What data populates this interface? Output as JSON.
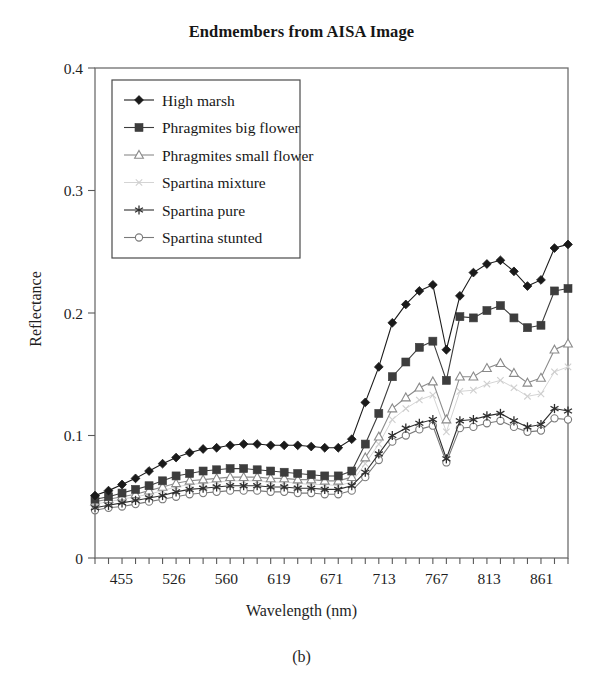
{
  "chart_data": {
    "type": "line",
    "title": "Endmembers from AISA Image",
    "caption": "(b)",
    "xlabel": "Wavelength (nm)",
    "ylabel": "Reflectance",
    "xtick_labels": [
      "455",
      "526",
      "560",
      "619",
      "671",
      "713",
      "767",
      "813",
      "861"
    ],
    "ytick_labels": [
      "0",
      "0.1",
      "0.2",
      "0.3",
      "0.4"
    ],
    "ylim": [
      0,
      0.4
    ],
    "xlim": [
      0,
      35
    ],
    "grid": false,
    "legend_position": "upper-left-inside",
    "x": [
      0,
      1,
      2,
      3,
      4,
      5,
      6,
      7,
      8,
      9,
      10,
      11,
      12,
      13,
      14,
      15,
      16,
      17,
      18,
      19,
      20,
      21,
      22,
      23,
      24,
      25,
      26,
      27,
      28,
      29,
      30,
      31,
      32,
      33,
      34,
      35
    ],
    "series": [
      {
        "name": "High marsh",
        "marker": "filled-diamond",
        "color": "#1a1a1a",
        "values": [
          0.051,
          0.055,
          0.06,
          0.065,
          0.071,
          0.077,
          0.082,
          0.086,
          0.089,
          0.09,
          0.092,
          0.093,
          0.093,
          0.092,
          0.092,
          0.092,
          0.091,
          0.09,
          0.09,
          0.097,
          0.127,
          0.156,
          0.192,
          0.207,
          0.218,
          0.223,
          0.17,
          0.214,
          0.233,
          0.24,
          0.243,
          0.234,
          0.222,
          0.227,
          0.253,
          0.256
        ]
      },
      {
        "name": "Phragmites big flower",
        "marker": "filled-square",
        "color": "#3d3d3d",
        "values": [
          0.048,
          0.05,
          0.053,
          0.056,
          0.059,
          0.063,
          0.067,
          0.069,
          0.071,
          0.072,
          0.073,
          0.073,
          0.072,
          0.071,
          0.07,
          0.069,
          0.068,
          0.067,
          0.067,
          0.071,
          0.093,
          0.118,
          0.148,
          0.16,
          0.172,
          0.177,
          0.145,
          0.197,
          0.196,
          0.202,
          0.206,
          0.196,
          0.188,
          0.19,
          0.218,
          0.22
        ]
      },
      {
        "name": "Phragmites small flower",
        "marker": "open-triangle",
        "color": "#8a8a8a",
        "values": [
          0.046,
          0.048,
          0.05,
          0.052,
          0.055,
          0.058,
          0.061,
          0.063,
          0.064,
          0.065,
          0.066,
          0.066,
          0.066,
          0.065,
          0.065,
          0.064,
          0.064,
          0.063,
          0.063,
          0.066,
          0.082,
          0.099,
          0.122,
          0.131,
          0.139,
          0.144,
          0.113,
          0.148,
          0.148,
          0.155,
          0.159,
          0.151,
          0.143,
          0.147,
          0.17,
          0.175
        ]
      },
      {
        "name": "Spartina mixture",
        "marker": "small-x",
        "color": "#cfcfcf",
        "values": [
          0.044,
          0.046,
          0.048,
          0.05,
          0.052,
          0.055,
          0.058,
          0.06,
          0.061,
          0.062,
          0.063,
          0.063,
          0.063,
          0.062,
          0.062,
          0.061,
          0.06,
          0.06,
          0.059,
          0.062,
          0.077,
          0.093,
          0.113,
          0.122,
          0.129,
          0.133,
          0.103,
          0.136,
          0.137,
          0.142,
          0.145,
          0.139,
          0.132,
          0.134,
          0.152,
          0.156
        ]
      },
      {
        "name": "Spartina pure",
        "marker": "asterisk",
        "color": "#2e2e2e",
        "values": [
          0.041,
          0.043,
          0.045,
          0.047,
          0.049,
          0.051,
          0.054,
          0.056,
          0.057,
          0.058,
          0.059,
          0.059,
          0.059,
          0.058,
          0.058,
          0.057,
          0.057,
          0.056,
          0.056,
          0.059,
          0.07,
          0.085,
          0.1,
          0.106,
          0.11,
          0.113,
          0.081,
          0.112,
          0.113,
          0.116,
          0.118,
          0.112,
          0.107,
          0.109,
          0.122,
          0.12
        ]
      },
      {
        "name": "Spartina stunted",
        "marker": "open-circle",
        "color": "#7a7a7a",
        "values": [
          0.039,
          0.041,
          0.042,
          0.044,
          0.046,
          0.048,
          0.05,
          0.052,
          0.053,
          0.054,
          0.055,
          0.055,
          0.055,
          0.054,
          0.054,
          0.053,
          0.053,
          0.052,
          0.052,
          0.055,
          0.066,
          0.08,
          0.095,
          0.1,
          0.105,
          0.108,
          0.078,
          0.106,
          0.107,
          0.11,
          0.112,
          0.107,
          0.103,
          0.104,
          0.114,
          0.113
        ]
      }
    ]
  }
}
